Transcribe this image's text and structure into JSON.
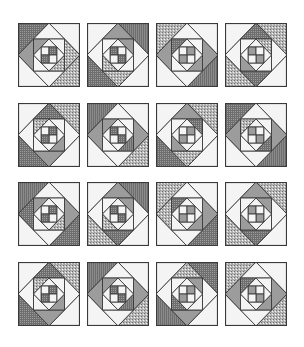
{
  "figure": {
    "rows": 4,
    "cols": 4,
    "block_width": 62,
    "block_height": 64,
    "col_x": [
      18,
      87,
      156,
      225
    ],
    "row_y": [
      23,
      103,
      182,
      262
    ]
  },
  "palette": {
    "line": "#3a3a3a",
    "white": "#f4f4f4",
    "light": "#e2e2e2",
    "mid": "#9c9c9c",
    "dark": "#6e6e6e",
    "speckle": "#b8b8b8",
    "stripe": "#8a8a8a"
  },
  "blocks": [
    {
      "corners": [
        "dark",
        "white",
        "speckle",
        "white"
      ],
      "ring1": [
        "white",
        "speckle",
        "white",
        "mid"
      ],
      "mid_sq": [
        "mid",
        "white",
        "speckle",
        "white"
      ],
      "ring2": [
        "white",
        "white",
        "white",
        "white"
      ],
      "center": [
        "white",
        "dark",
        "white",
        "dark"
      ]
    },
    {
      "corners": [
        "white",
        "stripe",
        "white",
        "dark"
      ],
      "ring1": [
        "mid",
        "white",
        "speckle",
        "white"
      ],
      "mid_sq": [
        "white",
        "mid",
        "white",
        "speckle"
      ],
      "ring2": [
        "white",
        "white",
        "white",
        "white"
      ],
      "center": [
        "dark",
        "white",
        "dark",
        "white"
      ]
    },
    {
      "corners": [
        "speckle",
        "white",
        "stripe",
        "white"
      ],
      "ring1": [
        "white",
        "mid",
        "white",
        "mid"
      ],
      "mid_sq": [
        "dark",
        "white",
        "mid",
        "white"
      ],
      "ring2": [
        "white",
        "white",
        "white",
        "white"
      ],
      "center": [
        "white",
        "mid",
        "white",
        "mid"
      ]
    },
    {
      "corners": [
        "white",
        "speckle",
        "white",
        "speckle"
      ],
      "ring1": [
        "dark",
        "white",
        "dark",
        "white"
      ],
      "mid_sq": [
        "white",
        "speckle",
        "white",
        "mid"
      ],
      "ring2": [
        "white",
        "white",
        "white",
        "white"
      ],
      "center": [
        "mid",
        "white",
        "mid",
        "white"
      ]
    },
    {
      "corners": [
        "white",
        "speckle",
        "white",
        "dark"
      ],
      "ring1": [
        "dark",
        "white",
        "mid",
        "white"
      ],
      "mid_sq": [
        "speckle",
        "white",
        "mid",
        "white"
      ],
      "ring2": [
        "white",
        "white",
        "white",
        "white"
      ],
      "center": [
        "white",
        "dark",
        "white",
        "dark"
      ]
    },
    {
      "corners": [
        "stripe",
        "white",
        "speckle",
        "white"
      ],
      "ring1": [
        "white",
        "mid",
        "white",
        "mid"
      ],
      "mid_sq": [
        "mid",
        "white",
        "stripe",
        "white"
      ],
      "ring2": [
        "white",
        "white",
        "white",
        "white"
      ],
      "center": [
        "dark",
        "white",
        "dark",
        "white"
      ]
    },
    {
      "corners": [
        "white",
        "speckle",
        "white",
        "dark"
      ],
      "ring1": [
        "mid",
        "white",
        "speckle",
        "white"
      ],
      "mid_sq": [
        "white",
        "dark",
        "white",
        "mid"
      ],
      "ring2": [
        "white",
        "white",
        "white",
        "white"
      ],
      "center": [
        "white",
        "mid",
        "white",
        "mid"
      ]
    },
    {
      "corners": [
        "dark",
        "white",
        "stripe",
        "white"
      ],
      "ring1": [
        "white",
        "mid",
        "white",
        "mid"
      ],
      "mid_sq": [
        "speckle",
        "white",
        "dark",
        "white"
      ],
      "ring2": [
        "white",
        "white",
        "white",
        "white"
      ],
      "center": [
        "mid",
        "white",
        "mid",
        "white"
      ]
    },
    {
      "corners": [
        "stripe",
        "white",
        "dark",
        "white"
      ],
      "ring1": [
        "white",
        "mid",
        "white",
        "dark"
      ],
      "mid_sq": [
        "mid",
        "white",
        "speckle",
        "white"
      ],
      "ring2": [
        "white",
        "white",
        "white",
        "white"
      ],
      "center": [
        "white",
        "dark",
        "white",
        "dark"
      ]
    },
    {
      "corners": [
        "white",
        "stripe",
        "white",
        "speckle"
      ],
      "ring1": [
        "mid",
        "white",
        "dark",
        "white"
      ],
      "mid_sq": [
        "white",
        "mid",
        "white",
        "speckle"
      ],
      "ring2": [
        "white",
        "white",
        "white",
        "white"
      ],
      "center": [
        "dark",
        "white",
        "dark",
        "white"
      ]
    },
    {
      "corners": [
        "speckle",
        "white",
        "dark",
        "white"
      ],
      "ring1": [
        "white",
        "mid",
        "white",
        "speckle"
      ],
      "mid_sq": [
        "dark",
        "white",
        "mid",
        "white"
      ],
      "ring2": [
        "white",
        "white",
        "white",
        "white"
      ],
      "center": [
        "white",
        "mid",
        "white",
        "mid"
      ]
    },
    {
      "corners": [
        "white",
        "speckle",
        "white",
        "speckle"
      ],
      "ring1": [
        "mid",
        "white",
        "dark",
        "white"
      ],
      "mid_sq": [
        "white",
        "mid",
        "white",
        "mid"
      ],
      "ring2": [
        "white",
        "white",
        "white",
        "white"
      ],
      "center": [
        "mid",
        "white",
        "mid",
        "white"
      ]
    },
    {
      "corners": [
        "white",
        "speckle",
        "white",
        "dark"
      ],
      "ring1": [
        "dark",
        "white",
        "mid",
        "white"
      ],
      "mid_sq": [
        "speckle",
        "white",
        "mid",
        "white"
      ],
      "ring2": [
        "white",
        "white",
        "white",
        "white"
      ],
      "center": [
        "white",
        "dark",
        "white",
        "dark"
      ]
    },
    {
      "corners": [
        "stripe",
        "white",
        "speckle",
        "white"
      ],
      "ring1": [
        "white",
        "mid",
        "white",
        "mid"
      ],
      "mid_sq": [
        "mid",
        "white",
        "stripe",
        "white"
      ],
      "ring2": [
        "white",
        "white",
        "white",
        "white"
      ],
      "center": [
        "dark",
        "white",
        "dark",
        "white"
      ]
    },
    {
      "corners": [
        "white",
        "dark",
        "white",
        "stripe"
      ],
      "ring1": [
        "speckle",
        "white",
        "mid",
        "white"
      ],
      "mid_sq": [
        "white",
        "mid",
        "white",
        "dark"
      ],
      "ring2": [
        "white",
        "white",
        "white",
        "white"
      ],
      "center": [
        "white",
        "mid",
        "white",
        "mid"
      ]
    },
    {
      "corners": [
        "speckle",
        "white",
        "speckle",
        "white"
      ],
      "ring1": [
        "white",
        "mid",
        "white",
        "mid"
      ],
      "mid_sq": [
        "dark",
        "white",
        "mid",
        "white"
      ],
      "ring2": [
        "white",
        "white",
        "white",
        "white"
      ],
      "center": [
        "mid",
        "white",
        "mid",
        "white"
      ]
    }
  ]
}
